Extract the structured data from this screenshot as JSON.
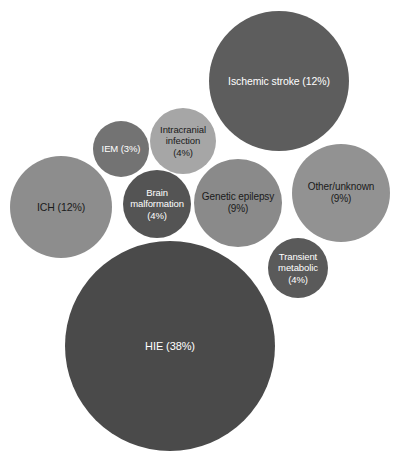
{
  "figure": {
    "background_color": "#ffffff",
    "width": 397,
    "height": 457
  },
  "chart_data": {
    "type": "bubble",
    "title": "",
    "subtitle": "",
    "xlabel": "",
    "ylabel": "",
    "grid": false,
    "legend": "none",
    "axes_visible": false,
    "value_unit": "percent",
    "note": "Packed-circle (bubble) chart; circle area encodes percentage share of neonatal seizure etiologies.",
    "categories": [
      "HIE",
      "Ischemic stroke",
      "ICH",
      "Genetic epilepsy",
      "Other/unknown",
      "Intracranial infection",
      "Brain malformation",
      "Transient metabolic",
      "IEM"
    ],
    "values": [
      38,
      12,
      12,
      9,
      9,
      4,
      4,
      4,
      3
    ],
    "bubbles": [
      {
        "key": "hie",
        "name": "HIE",
        "value": 38,
        "label": "HIE (38%)",
        "cx": 170,
        "cy": 346,
        "r": 105,
        "color": "#4a4a4a",
        "text_color": "#ffffff",
        "font_size": 11
      },
      {
        "key": "ischemic-stroke",
        "name": "Ischemic stroke",
        "value": 12,
        "label": "Ischemic stroke (12%)",
        "cx": 279,
        "cy": 81,
        "r": 70,
        "color": "#5d5d5d",
        "text_color": "#ffffff",
        "font_size": 10.5
      },
      {
        "key": "ich",
        "name": "ICH",
        "value": 12,
        "label": "ICH (12%)",
        "cx": 61,
        "cy": 207,
        "r": 51,
        "color": "#8d8d8d",
        "text_color": "#1a1a1a",
        "font_size": 10.5
      },
      {
        "key": "genetic-epilepsy",
        "name": "Genetic epilepsy",
        "value": 9,
        "label": "Genetic epilepsy\n(9%)",
        "cx": 238,
        "cy": 203,
        "r": 44,
        "color": "#8a8a8a",
        "text_color": "#1a1a1a",
        "font_size": 10
      },
      {
        "key": "other-unknown",
        "name": "Other/unknown",
        "value": 9,
        "label": "Other/unknown\n(9%)",
        "cx": 341,
        "cy": 193,
        "r": 49,
        "color": "#929292",
        "text_color": "#1a1a1a",
        "font_size": 10
      },
      {
        "key": "intracranial-infection",
        "name": "Intracranial infection",
        "value": 4,
        "label": "Intracranial\ninfection\n(4%)",
        "cx": 183,
        "cy": 141,
        "r": 33,
        "color": "#a6a6a6",
        "text_color": "#1a1a1a",
        "font_size": 9.5
      },
      {
        "key": "brain-malformation",
        "name": "Brain malformation",
        "value": 4,
        "label": "Brain\nmalformation\n(4%)",
        "cx": 157,
        "cy": 204,
        "r": 34,
        "color": "#545454",
        "text_color": "#ffffff",
        "font_size": 9.5
      },
      {
        "key": "transient-metabolic",
        "name": "Transient metabolic",
        "value": 4,
        "label": "Transient\nmetabolic\n(4%)",
        "cx": 298,
        "cy": 268,
        "r": 30,
        "color": "#5a5a5a",
        "text_color": "#ffffff",
        "font_size": 9.5
      },
      {
        "key": "iem",
        "name": "IEM",
        "value": 3,
        "label": "IEM (3%)",
        "cx": 121,
        "cy": 149,
        "r": 28,
        "color": "#737373",
        "text_color": "#ffffff",
        "font_size": 9.5
      }
    ]
  }
}
